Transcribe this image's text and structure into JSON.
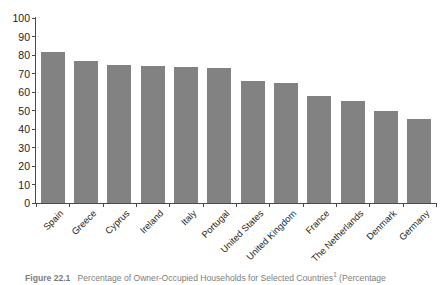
{
  "figure": {
    "caption_number": "Figure 22.1",
    "caption_text": "Percentage of Owner-Occupied Households for Selected Countries",
    "caption_footnote_marker": "1",
    "caption_tail": "(Percentage"
  },
  "chart_data": {
    "type": "bar",
    "title": "",
    "xlabel": "",
    "ylabel": "",
    "ylim": [
      0,
      100
    ],
    "ytick_values": [
      0,
      10,
      20,
      30,
      40,
      50,
      60,
      70,
      80,
      90,
      100
    ],
    "ytick_labels": [
      "0",
      "10",
      "20",
      "30",
      "40",
      "50",
      "60",
      "70",
      "80",
      "90",
      "100"
    ],
    "grid": false,
    "legend": "none",
    "bar_color": "#828282",
    "axis_color": "#4a4a4a",
    "categories": [
      "Spain",
      "Greece",
      "Cyprus",
      "Ireland",
      "Italy",
      "Portugal",
      "United States",
      "United Kingdom",
      "France",
      "The Netherlands",
      "Denmark",
      "Germany"
    ],
    "values": [
      81.5,
      77.0,
      74.5,
      74.3,
      73.3,
      73.0,
      66.0,
      65.0,
      58.0,
      55.0,
      49.5,
      45.5
    ]
  }
}
